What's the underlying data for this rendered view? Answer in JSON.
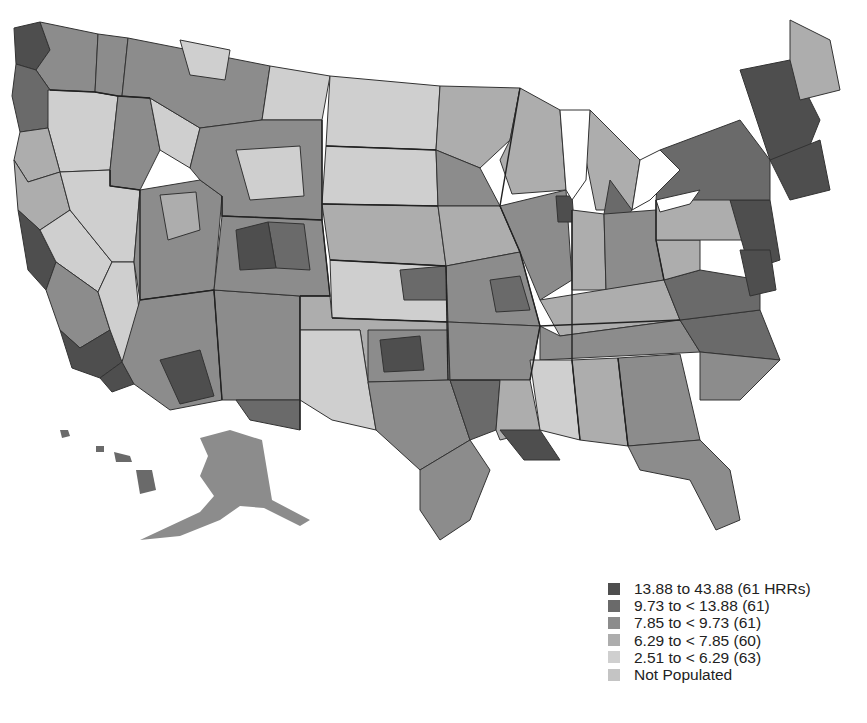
{
  "map": {
    "subject": "United States by Hospital Referral Region (HRR)",
    "type": "choropleth",
    "palette": [
      "#4e4e4e",
      "#6a6a6a",
      "#8c8c8c",
      "#adadad",
      "#cfcfcf",
      "#c4c4c4"
    ],
    "outline_color": "#333333",
    "notable_regions": [
      {
        "name": "New England",
        "class": 0
      },
      {
        "name": "Mid-Atlantic",
        "class": 0
      },
      {
        "name": "Puget Sound",
        "class": 0
      },
      {
        "name": "Southern California",
        "class": 0
      },
      {
        "name": "Colorado Front Range",
        "class": 1
      },
      {
        "name": "Louisiana coast",
        "class": 0
      },
      {
        "name": "Alaska",
        "class": 2
      },
      {
        "name": "Hawaii",
        "class": 1
      },
      {
        "name": "Nevada",
        "class": 4
      },
      {
        "name": "Northern Plains",
        "class": 4
      }
    ]
  },
  "legend": {
    "items": [
      {
        "label": "13.88 to 43.88 (61 HRRs)",
        "color": "#4e4e4e"
      },
      {
        "label": "9.73 to < 13.88 (61)",
        "color": "#6a6a6a"
      },
      {
        "label": "7.85 to < 9.73 (61)",
        "color": "#8c8c8c"
      },
      {
        "label": "6.29 to < 7.85 (60)",
        "color": "#adadad"
      },
      {
        "label": "2.51 to < 6.29 (63)",
        "color": "#cfcfcf"
      },
      {
        "label": "Not Populated",
        "color": "#c4c4c4"
      }
    ]
  }
}
